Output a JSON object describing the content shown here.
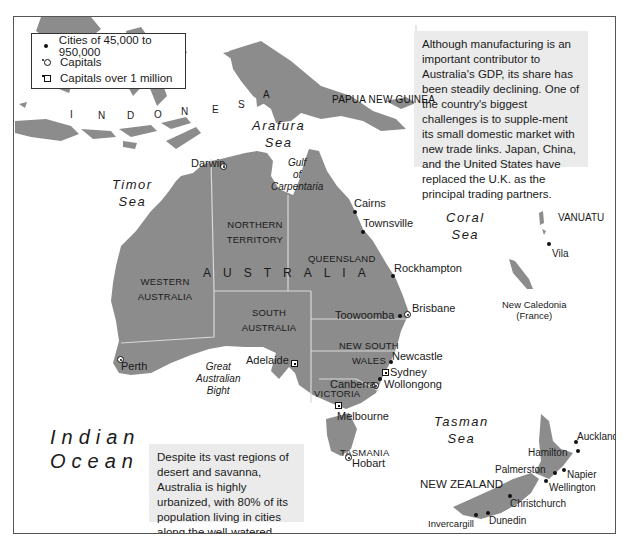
{
  "legend": {
    "items": [
      {
        "symbol": "city-dot",
        "label": "Cities of 45,000 to 950,000"
      },
      {
        "symbol": "capital-circle-star",
        "label": "Capitals"
      },
      {
        "symbol": "capital-square-star",
        "label": "Capitals over 1 million"
      }
    ]
  },
  "info_boxes": {
    "economy": "Although manufacturing is an important contributor to Australia's GDP, its share has been steadily declining. One of the country's biggest challenges is to supple-ment its small domestic market with new trade links. Japan, China, and the United States have replaced the U.K. as the principal trading partners.",
    "urbanization": "Despite its vast regions of desert and savanna, Australia is highly urbanized, with 80% of its population living in cities along the well-watered coast."
  },
  "regions": {
    "indonesia": "INDONESIA",
    "indonesia_letters": [
      "I",
      "N",
      "D",
      "O",
      "N",
      "E",
      "S",
      "I",
      "A"
    ],
    "papua_new_guinea": "PAPUA NEW GUINEA",
    "australia": "AUSTRALIA",
    "western_australia": "WESTERN AUSTRALIA",
    "northern_territory": "NORTHERN TERRITORY",
    "queensland": "QUEENSLAND",
    "south_australia": "SOUTH AUSTRALIA",
    "new_south_wales": "NEW SOUTH WALES",
    "victoria": "VICTORIA",
    "tasmania": "TASMANIA",
    "new_zealand": "NEW ZEALAND",
    "vanuatu": "VANUATU",
    "new_caledonia": "New Caledonia",
    "new_caledonia_note": "(France)"
  },
  "water_bodies": {
    "arafura_sea": [
      "Arafura",
      "Sea"
    ],
    "timor_sea": [
      "Timor",
      "Sea"
    ],
    "gulf_of_carpentaria": [
      "Gulf",
      "of",
      "Carpentaria"
    ],
    "coral_sea": [
      "Coral",
      "Sea"
    ],
    "great_australian_bight": [
      "Great",
      "Australian",
      "Bight"
    ],
    "indian_ocean": [
      "Indian",
      "Ocean"
    ],
    "tasman_sea": [
      "Tasman",
      "Sea"
    ]
  },
  "cities": {
    "darwin": {
      "name": "Darwin",
      "type": "capital"
    },
    "cairns": {
      "name": "Cairns",
      "type": "city"
    },
    "townsville": {
      "name": "Townsville",
      "type": "city"
    },
    "rockhampton": {
      "name": "Rockhampton",
      "type": "city"
    },
    "toowoomba": {
      "name": "Toowoomba",
      "type": "city"
    },
    "brisbane": {
      "name": "Brisbane",
      "type": "capital_over_1m"
    },
    "newcastle": {
      "name": "Newcastle",
      "type": "city"
    },
    "sydney": {
      "name": "Sydney",
      "type": "capital_over_1m"
    },
    "wollongong": {
      "name": "Wollongong",
      "type": "city"
    },
    "canberra": {
      "name": "Canberra",
      "type": "capital"
    },
    "melbourne": {
      "name": "Melbourne",
      "type": "capital_over_1m"
    },
    "adelaide": {
      "name": "Adelaide",
      "type": "capital_over_1m"
    },
    "perth": {
      "name": "Perth",
      "type": "capital_over_1m"
    },
    "hobart": {
      "name": "Hobart",
      "type": "capital"
    },
    "vila": {
      "name": "Vila",
      "type": "capital"
    },
    "auckland": {
      "name": "Auckland",
      "type": "city"
    },
    "hamilton": {
      "name": "Hamilton",
      "type": "city"
    },
    "palmerston": {
      "name": "Palmerston",
      "type": "city"
    },
    "napier": {
      "name": "Napier",
      "type": "city"
    },
    "wellington": {
      "name": "Wellington",
      "type": "capital"
    },
    "christchurch": {
      "name": "Christchurch",
      "type": "city"
    },
    "dunedin": {
      "name": "Dunedin",
      "type": "city"
    },
    "invercargill": {
      "name": "Invercargill",
      "type": "city"
    }
  },
  "colors": {
    "land": "#8c8c8c",
    "water": "#ffffff",
    "info_box": "#ebebeb",
    "border": "#555555",
    "state_border": "#d8d8d8"
  }
}
